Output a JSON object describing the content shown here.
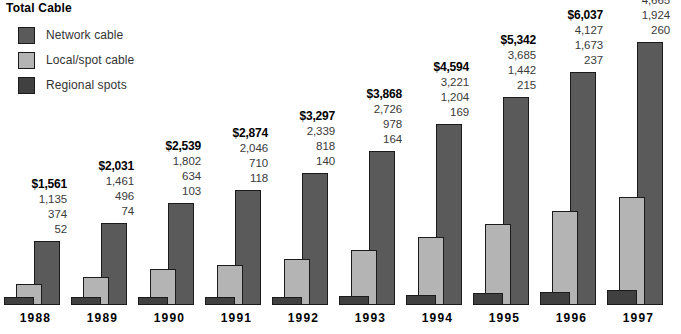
{
  "title": "Total Cable",
  "legend": {
    "position": "top-left",
    "items": [
      {
        "label": "Network cable",
        "color": "#5a5a5a",
        "name": "network-cable"
      },
      {
        "label": "Local/spot cable",
        "color": "#b4b4b4",
        "name": "local-spot-cable"
      },
      {
        "label": "Regional spots",
        "color": "#404040",
        "name": "regional-spots"
      }
    ]
  },
  "chart_data": {
    "type": "bar",
    "title": "Total Cable",
    "xlabel": "",
    "ylabel": "",
    "grid": false,
    "legend_position": "top-left",
    "ylim": [
      0,
      5200
    ],
    "axis_visible": false,
    "tick_labels_visible": false,
    "categories": [
      "1988",
      "1989",
      "1990",
      "1991",
      "1992",
      "1993",
      "1994",
      "1995",
      "1996",
      "1997"
    ],
    "totals": [
      1561,
      2031,
      2539,
      2874,
      3297,
      3868,
      4594,
      5342,
      6037,
      6849
    ],
    "totals_display": [
      "$1,561",
      "$2,031",
      "$2,539",
      "$2,874",
      "$3,297",
      "$3,868",
      "$4,594",
      "$5,342",
      "$6,037",
      "$6,849"
    ],
    "series": [
      {
        "name": "Network cable",
        "color": "#5a5a5a",
        "values": [
          1135,
          1461,
          1802,
          2046,
          2339,
          2726,
          3221,
          3685,
          4127,
          4665
        ],
        "values_display": [
          "1,135",
          "1,461",
          "1,802",
          "2,046",
          "2,339",
          "2,726",
          "3,221",
          "3,685",
          "4,127",
          "4,665"
        ]
      },
      {
        "name": "Local/spot cable",
        "color": "#b4b4b4",
        "values": [
          374,
          496,
          634,
          710,
          818,
          978,
          1204,
          1442,
          1673,
          1924
        ],
        "values_display": [
          "374",
          "496",
          "634",
          "710",
          "818",
          "978",
          "1,204",
          "1,442",
          "1,673",
          "1,924"
        ]
      },
      {
        "name": "Regional spots",
        "color": "#404040",
        "values": [
          52,
          74,
          103,
          118,
          140,
          164,
          169,
          215,
          237,
          260
        ],
        "values_display": [
          "52",
          "74",
          "103",
          "118",
          "140",
          "164",
          "169",
          "215",
          "237",
          "260"
        ]
      }
    ]
  }
}
